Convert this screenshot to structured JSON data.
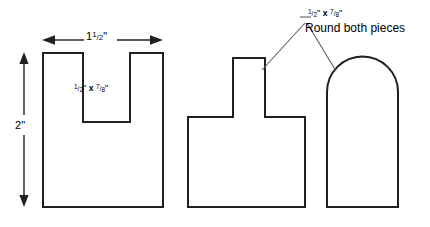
{
  "drawing": {
    "title": "Three woodworking piece profiles with dimensions",
    "stroke_color": "#231f20",
    "leader_color": "#5b5f66",
    "background": "#ffffff",
    "dimensions": {
      "width_label": "1 1/2\"",
      "width_whole": "1",
      "width_num": "1",
      "width_den": "2",
      "width_unit": "\"",
      "height_label": "2\"",
      "height_value": "2",
      "height_unit": "\""
    },
    "notch_note": {
      "full": "1/2\" x 7/8\"",
      "first_num": "1",
      "first_den": "2",
      "first_unit": "\"",
      "operator": "x",
      "second_num": "7",
      "second_den": "8",
      "second_unit": "\""
    },
    "round_note": {
      "size_full": "1/2\" x 7/8\"",
      "size_first_num": "1",
      "size_first_den": "2",
      "size_first_unit": "\"",
      "size_operator": "x",
      "size_second_num": "7",
      "size_second_den": "8",
      "size_second_unit": "\"",
      "instruction": "Round both pieces"
    },
    "shapes": [
      {
        "name": "u-shaped-piece",
        "description": "Rectangle with rectangular notch cut into top center",
        "path": "M 43 53 L 83 53 L 83 122 L 130 122 L 130 53 L 163 53 L 163 207 L 43 207 Z"
      },
      {
        "name": "t-shaped-piece",
        "description": "Rectangle with rectangular tab protruding from top center",
        "path": "M 188 117 L 233 117 L 233 58 L 265 58 L 265 117 L 305 117 L 305 207 L 188 207 Z"
      },
      {
        "name": "arched-piece",
        "description": "Rectangle with semicircular rounded top",
        "path": "M 327 207 L 327 92 A 35.5 35.5 0 0 1 398 92 L 398 207 Z"
      }
    ],
    "annotations": {
      "h_arrow_left_x": 42,
      "h_arrow_right_x": 163,
      "h_arrow_y": 40,
      "v_arrow_x": 24,
      "v_arrow_top_y": 52,
      "v_arrow_bottom_y": 207,
      "leader_apex_x": 306,
      "leader_apex_y": 22,
      "leader_left_end_x": 262,
      "leader_left_end_y": 68,
      "leader_right_end_x": 334,
      "leader_right_end_y": 70
    }
  }
}
